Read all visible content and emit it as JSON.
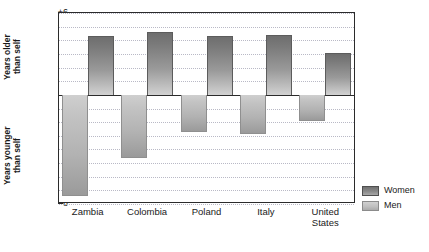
{
  "chart_data": {
    "type": "bar",
    "title": "",
    "subtitle": "",
    "xlabel": "",
    "ylabel": "",
    "ylim": [
      -8,
      6
    ],
    "grid": true,
    "legend_position": "right-bottom",
    "orientation": "vertical",
    "zero_reference_line": true,
    "categories": [
      "Zambia",
      "Colombia",
      "Poland",
      "Italy",
      "United States"
    ],
    "category_lines": [
      [
        "Zambia"
      ],
      [
        "Colombia"
      ],
      [
        "Poland"
      ],
      [
        "Italy"
      ],
      [
        "United",
        "States"
      ]
    ],
    "series": [
      {
        "name": "Women",
        "color": "#8a8a8a",
        "values": [
          4.3,
          4.6,
          4.3,
          4.4,
          3.1
        ]
      },
      {
        "name": "Men",
        "color": "#c3c3c3",
        "values": [
          -7.4,
          -4.6,
          -2.7,
          -2.9,
          -1.9
        ]
      }
    ],
    "yticks": [
      {
        "value": 6,
        "label": "+6"
      },
      {
        "value": 5,
        "label": "+5"
      },
      {
        "value": 4,
        "label": "+4"
      },
      {
        "value": 3,
        "label": "+3"
      },
      {
        "value": 2,
        "label": "+2"
      },
      {
        "value": 1,
        "label": "+1"
      },
      {
        "value": 0,
        "label": "0"
      },
      {
        "value": -1,
        "label": "-1"
      },
      {
        "value": -2,
        "label": "-2"
      },
      {
        "value": -3,
        "label": "-3"
      },
      {
        "value": -4,
        "label": "-4"
      },
      {
        "value": -5,
        "label": "-5"
      },
      {
        "value": -6,
        "label": "-6"
      },
      {
        "value": -7,
        "label": "-7"
      },
      {
        "value": -8,
        "label": "-8"
      }
    ]
  },
  "axis_titles": {
    "upper": {
      "line1": "Years older",
      "line2": "than self"
    },
    "lower": {
      "line1": "Years younger",
      "line2": "than self"
    }
  },
  "legend": {
    "items": [
      {
        "label": "Women",
        "swatch": "women-swatch"
      },
      {
        "label": "Men",
        "swatch": "men-swatch"
      }
    ]
  }
}
